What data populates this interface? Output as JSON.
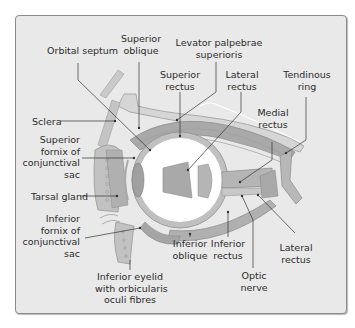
{
  "diagram": {
    "type": "anatomical-cross-section",
    "colors": {
      "background": "#ffffff",
      "panel": "#e9e9e9",
      "panel_border": "#8a8a8a",
      "tissue": "#bdbdbd",
      "muscle": "#a9a9a9",
      "muscle_dark": "#8f8f8f",
      "eyeball": "#ffffff",
      "leader_line": "#333333"
    },
    "labels": {
      "orbital_septum": "Orbital septum",
      "superior_oblique": "Superior\noblique",
      "levator": "Levator palpebrae\nsuperioris",
      "superior_rectus": "Superior\nrectus",
      "lateral_rectus_top": "Lateral\nrectus",
      "tendinous_ring": "Tendinous\nring",
      "medial_rectus": "Medial\nrectus",
      "sclera": "Sclera",
      "superior_fornix": "Superior\nfornix of\nconjunctival\nsac",
      "tarsal_gland": "Tarsal gland",
      "inferior_fornix": "Inferior\nfornix of\nconjunctival\nsac",
      "inferior_eyelid": "Inferior eyelid\nwith orbicularis\noculi fibres",
      "inferior_oblique": "Inferior\noblique",
      "inferior_rectus": "Inferior\nrectus",
      "optic_nerve": "Optic\nnerve",
      "lateral_rectus_bottom": "Lateral\nrectus"
    }
  }
}
